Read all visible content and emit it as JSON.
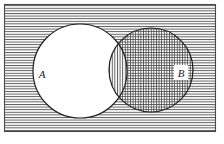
{
  "figure": {
    "type": "venn-diagram",
    "title": "",
    "caption": "",
    "background_color": "#ffffff",
    "stroke_color": "#2b2b2b",
    "hatch_color": "#555555",
    "frame": {
      "name": "universal-set-rectangle",
      "x": 4,
      "y": 4,
      "width": 212,
      "height": 128,
      "fill_pattern": "horizontal-lines",
      "stroke_width": 1
    },
    "regions": [
      {
        "id": "universe-outside",
        "label": "",
        "fill_pattern": "horizontal-lines",
        "description": "region inside rectangle but outside both circles"
      },
      {
        "id": "a-only",
        "label": "",
        "fill_pattern": "none",
        "description": "region inside circle A only, unshaded white"
      },
      {
        "id": "intersection",
        "label": "",
        "fill_pattern": "vertical-lines",
        "description": "lens region where A and B overlap"
      },
      {
        "id": "b-only",
        "label": "",
        "fill_pattern": "cross-hatch",
        "description": "region inside circle B only, cross hatched grid"
      }
    ],
    "circles": [
      {
        "id": "circle-a",
        "label": "A",
        "cx": 80,
        "cy": 71,
        "r": 47,
        "fill_pattern": "none",
        "label_x": 42,
        "label_y": 75
      },
      {
        "id": "circle-b",
        "label": "B",
        "cx": 151,
        "cy": 70,
        "r": 42,
        "fill_pattern": "cross-hatch",
        "label_x": 181,
        "label_y": 74
      }
    ]
  }
}
